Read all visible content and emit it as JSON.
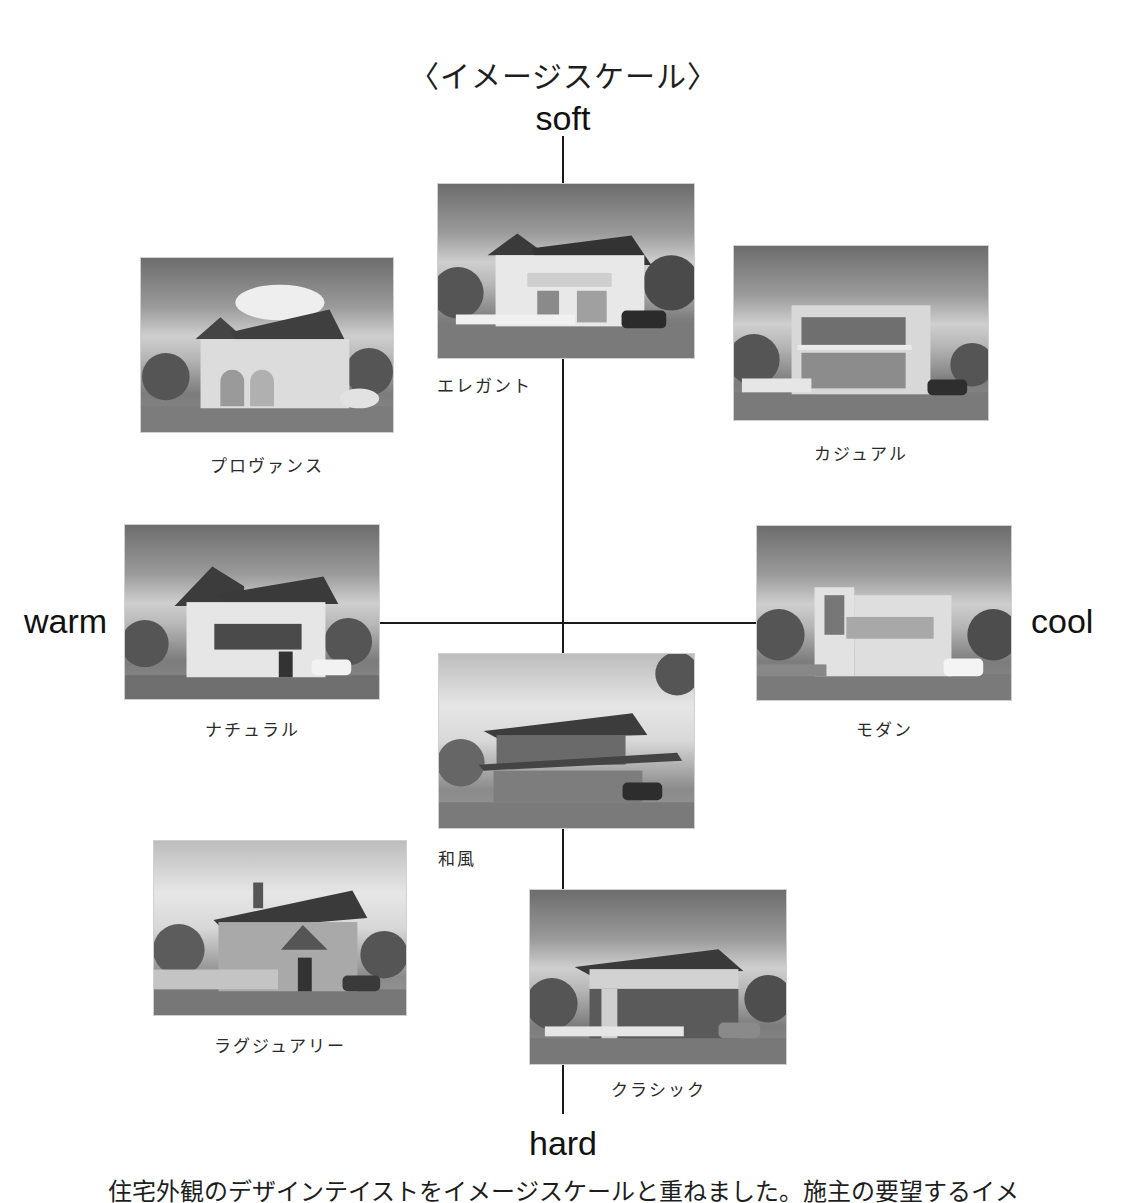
{
  "diagram": {
    "title": "〈イメージスケール〉",
    "axes": {
      "top": "soft",
      "bottom": "hard",
      "left": "warm",
      "right": "cool"
    },
    "styles": [
      {
        "id": "elegant",
        "label": "エレガント",
        "position": "top-center"
      },
      {
        "id": "provence",
        "label": "プロヴァンス",
        "position": "upper-left"
      },
      {
        "id": "casual",
        "label": "カジュアル",
        "position": "upper-right"
      },
      {
        "id": "natural",
        "label": "ナチュラル",
        "position": "middle-left"
      },
      {
        "id": "modern",
        "label": "モダン",
        "position": "middle-right"
      },
      {
        "id": "wafu",
        "label": "和風",
        "position": "center-below"
      },
      {
        "id": "luxury",
        "label": "ラグジュアリー",
        "position": "lower-left"
      },
      {
        "id": "classic",
        "label": "クラシック",
        "position": "bottom-center"
      }
    ],
    "footer_text": "住宅外観のデザインテイストをイメージスケールと重ねました。施主の要望するイメ"
  },
  "colors": {
    "background": "#ffffff",
    "axis_line": "#1a1a1a",
    "text": "#1e1e1e"
  }
}
